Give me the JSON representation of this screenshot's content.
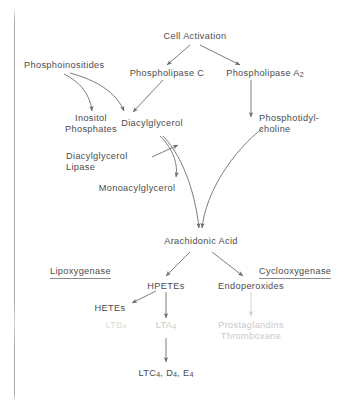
{
  "diagram": {
    "text_color": "#4c4c4c",
    "faded_color": "#c9c9c9",
    "background": "#ffffff",
    "nodes": {
      "cell_activation": "Cell Activation",
      "phosphoinositides": "Phosphoinositides",
      "phospholipase_c": "Phospholipase C",
      "phospholipase_a2_name": "Phospholipase A",
      "phospholipase_a2_sub": "2",
      "inositol_phosphates_line1": "Inositol",
      "inositol_phosphates_line2": "Phosphates",
      "diacylglycerol": "Diacylglycerol",
      "phosphotidylcholine_line1": "Phosphotidyl-",
      "phosphotidylcholine_line2": "choline",
      "diacylglycerol_lipase_line1": "Diacylglycerol",
      "diacylglycerol_lipase_line2": "Lipase",
      "monoacylglycerol": "Monoacylglycerol",
      "arachidonic_acid": "Arachidonic Acid",
      "lipoxygenase": "Lipoxygenase",
      "cyclooxygenase": "Cyclooxygenase",
      "hpetes": "HPETEs",
      "endoperoxides": "Endoperoxides",
      "hetes": "HETEs",
      "ltb4_name": "LTB",
      "ltb4_sub": "4",
      "lta4_name": "LTA",
      "lta4_sub": "4",
      "prostaglandins": "Prostaglandins",
      "thromboxane": "Thromboxane",
      "ltc4_de4_prefix": "LTC",
      "ltc4_sub": "4",
      "ltc4_sep1": ", D",
      "ltd4_sub": "4",
      "ltc4_sep2": ", E",
      "lte4_sub": "4"
    }
  }
}
